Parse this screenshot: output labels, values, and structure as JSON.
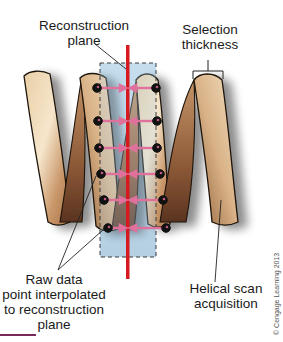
{
  "figure": {
    "labels": {
      "reconstruction_plane": [
        "Reconstruction",
        "plane"
      ],
      "selection_thickness": [
        "Selection",
        "thickness"
      ],
      "raw_data_point": [
        "Raw data",
        "point interpolated",
        "to reconstruction",
        "plane"
      ],
      "helical_scan": [
        "Helical scan",
        "acquisition"
      ]
    },
    "copyright": "© Cengage Learning 2013",
    "colors": {
      "reconstruction_plane_line": "#d71920",
      "interpolation_arrow": "#e0709c",
      "data_point": "#111111",
      "slab_fill": "#b9d6ea",
      "helix_light": "#f3dcb8",
      "helix_mid": "#d4a676",
      "helix_dark": "#8b5a34",
      "accent_bar": "#7a2a5a"
    },
    "data_points": {
      "rows_y": [
        88,
        121,
        148,
        174,
        200,
        228
      ],
      "left_x": [
        97,
        98,
        99,
        101,
        104,
        108
      ],
      "right_x": [
        156,
        157,
        157,
        160,
        163,
        166
      ]
    }
  }
}
